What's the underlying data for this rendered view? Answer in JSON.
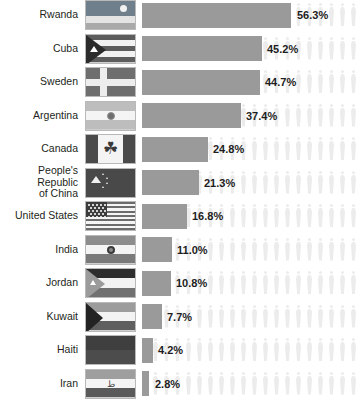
{
  "chart_data": {
    "type": "bar",
    "title": "",
    "subtitle": "",
    "xlabel": "",
    "ylabel": "",
    "orientation": "horizontal",
    "grid": false,
    "legend": false,
    "xlim": [
      0,
      60
    ],
    "categories": [
      "Rwanda",
      "Cuba",
      "Sweden",
      "Argentina",
      "Canada",
      "People's Republic\nof China",
      "United States",
      "India",
      "Jordan",
      "Kuwait",
      "Haiti",
      "Iran"
    ],
    "values": [
      56.3,
      45.2,
      44.7,
      37.4,
      24.8,
      21.3,
      16.8,
      11.0,
      10.8,
      7.7,
      4.2,
      2.8
    ],
    "value_labels": [
      "56.3%",
      "45.2%",
      "44.7%",
      "37.4%",
      "24.8%",
      "21.3%",
      "16.8%",
      "11.0%",
      "10.8%",
      "7.7%",
      "4.2%",
      "2.8%"
    ],
    "bar_color": "#9a9a9a",
    "background_figure_color": "#ececec",
    "label_color": "#231f20",
    "value_color": "#1d1d1d"
  },
  "rows": [
    {
      "label": "Rwanda",
      "value_label": "56.3%",
      "value": 56.3,
      "flag": "rwanda-flag"
    },
    {
      "label": "Cuba",
      "value_label": "45.2%",
      "value": 45.2,
      "flag": "cuba-flag"
    },
    {
      "label": "Sweden",
      "value_label": "44.7%",
      "value": 44.7,
      "flag": "sweden-flag"
    },
    {
      "label": "Argentina",
      "value_label": "37.4%",
      "value": 37.4,
      "flag": "argentina-flag"
    },
    {
      "label": "Canada",
      "value_label": "24.8%",
      "value": 24.8,
      "flag": "canada-flag"
    },
    {
      "label": "People's Republic\nof China",
      "value_label": "21.3%",
      "value": 21.3,
      "flag": "china-flag"
    },
    {
      "label": "United States",
      "value_label": "16.8%",
      "value": 16.8,
      "flag": "united-states-flag"
    },
    {
      "label": "India",
      "value_label": "11.0%",
      "value": 11.0,
      "flag": "india-flag"
    },
    {
      "label": "Jordan",
      "value_label": "10.8%",
      "value": 10.8,
      "flag": "jordan-flag"
    },
    {
      "label": "Kuwait",
      "value_label": "7.7%",
      "value": 7.7,
      "flag": "kuwait-flag"
    },
    {
      "label": "Haiti",
      "value_label": "4.2%",
      "value": 4.2,
      "flag": "haiti-flag"
    },
    {
      "label": "Iran",
      "value_label": "2.8%",
      "value": 2.8,
      "flag": "iran-flag"
    }
  ],
  "flag_glyphs": {
    "canada_maple_leaf": "☘",
    "iran_emblem": "ط"
  }
}
